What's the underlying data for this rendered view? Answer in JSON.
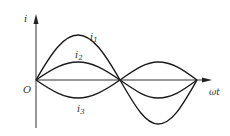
{
  "diagram": {
    "axes": {
      "y_label": "i",
      "x_label": "ωt",
      "origin_label": "O"
    },
    "curves": [
      {
        "name": "i1",
        "label": "i",
        "sub": "1",
        "amplitude": 45,
        "phase": "in phase"
      },
      {
        "name": "i2",
        "label": "i",
        "sub": "2",
        "amplitude": 18,
        "phase": "in phase"
      },
      {
        "name": "i3",
        "label": "i",
        "sub": "3",
        "amplitude": -18,
        "phase": "opposite phase"
      }
    ],
    "colors": {
      "line": "#1a1a1a",
      "axis": "#333333"
    }
  }
}
